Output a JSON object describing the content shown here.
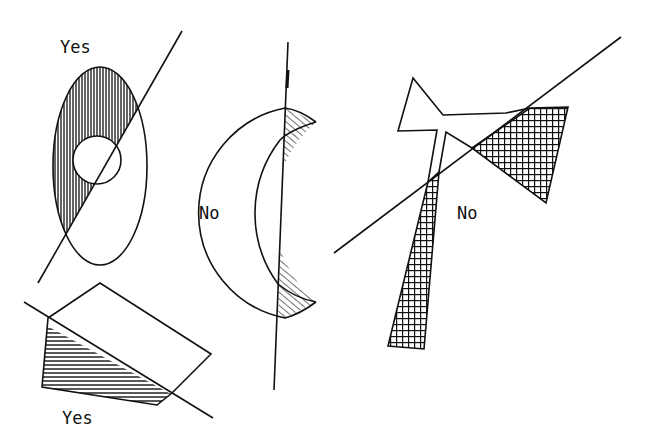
{
  "figures": [
    {
      "id": "ellipse-circle",
      "label": "Yes",
      "shading": "vertical-lines"
    },
    {
      "id": "crescent",
      "label": "No",
      "shading": "diagonal-lines"
    },
    {
      "id": "quadrilateral",
      "label": "Yes",
      "shading": "horizontal-lines"
    },
    {
      "id": "bowtie-polygon",
      "label": "No",
      "shading": "crosshatch"
    }
  ],
  "colors": {
    "ink": "#111111",
    "background": "#ffffff"
  }
}
